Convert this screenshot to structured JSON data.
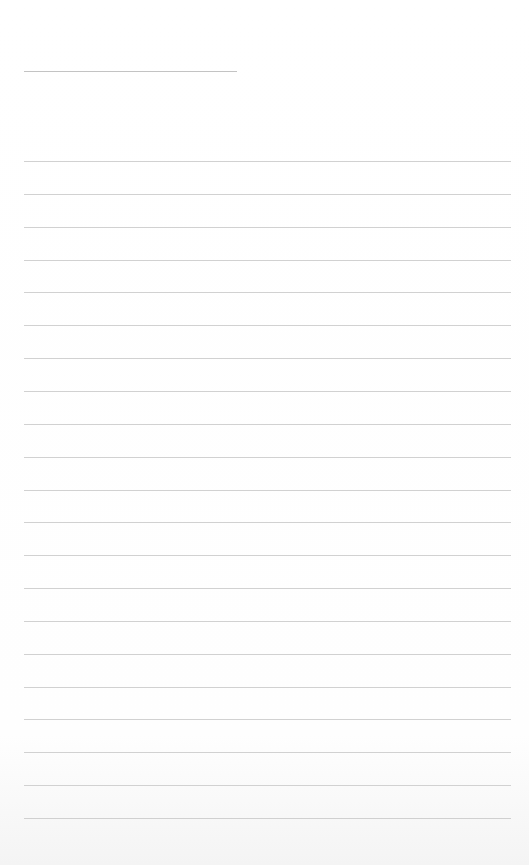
{
  "page": {
    "type": "blank-lined-sheet",
    "background_color": "#ffffff",
    "line_color": "#c9c9c9"
  },
  "header_rule": {
    "left": 24,
    "width": 213,
    "top": 71,
    "color": "#b8b8b8"
  },
  "ruled_lines": {
    "left": 24,
    "width": 487,
    "first_top": 161,
    "last_top": 818,
    "count": 21,
    "spacing": 32.85
  }
}
